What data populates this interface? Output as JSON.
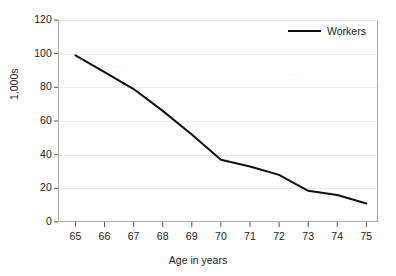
{
  "chart_data": {
    "type": "line",
    "title": "",
    "xlabel": "Age in years",
    "ylabel": "1,000s",
    "xlim": [
      64.4,
      75.4
    ],
    "ylim": [
      0,
      120
    ],
    "grid": true,
    "legend_position": "top-right",
    "x": [
      65,
      66,
      67,
      68,
      69,
      70,
      71,
      72,
      73,
      74,
      75
    ],
    "xtick_labels": [
      "65",
      "66",
      "67",
      "68",
      "69",
      "70",
      "71",
      "72",
      "73",
      "74",
      "75"
    ],
    "ytick_labels": [
      "0",
      "20",
      "40",
      "60",
      "80",
      "100",
      "120"
    ],
    "yticks": [
      0,
      20,
      40,
      60,
      80,
      100,
      120
    ],
    "series": [
      {
        "name": "Workers",
        "color": "#111111",
        "values": [
          99,
          89,
          79,
          66,
          52,
          37,
          33,
          28,
          18.5,
          16,
          11
        ]
      }
    ]
  },
  "legend": {
    "entries": [
      {
        "label": "Workers"
      }
    ]
  },
  "axes": {
    "x_title": "Age in years",
    "y_title": "1,000s"
  }
}
